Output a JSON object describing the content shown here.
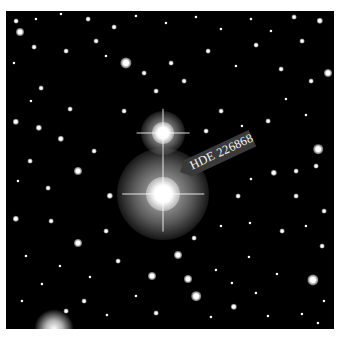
{
  "image": {
    "subject": "Star field photograph",
    "label": "HDE 226868",
    "background_color": "#000000",
    "frame_color": "#ffffff"
  },
  "bright_stars": [
    {
      "name": "upper-bright-star",
      "x": 157,
      "y": 122,
      "core": 22,
      "halo": 44
    },
    {
      "name": "target-star",
      "x": 157,
      "y": 183,
      "core": 34,
      "halo": 92
    }
  ],
  "stars": [
    {
      "x": 10,
      "y": 10,
      "r": 3
    },
    {
      "x": 30,
      "y": 8,
      "r": 2
    },
    {
      "x": 55,
      "y": 3,
      "r": 2
    },
    {
      "x": 82,
      "y": 8,
      "r": 3
    },
    {
      "x": 108,
      "y": 16,
      "r": 3
    },
    {
      "x": 130,
      "y": 5,
      "r": 2
    },
    {
      "x": 160,
      "y": 12,
      "r": 2
    },
    {
      "x": 190,
      "y": 6,
      "r": 2
    },
    {
      "x": 215,
      "y": 18,
      "r": 2
    },
    {
      "x": 245,
      "y": 8,
      "r": 2
    },
    {
      "x": 265,
      "y": 20,
      "r": 2
    },
    {
      "x": 288,
      "y": 6,
      "r": 3
    },
    {
      "x": 314,
      "y": 10,
      "r": 4
    },
    {
      "x": 14,
      "y": 21,
      "r": 5
    },
    {
      "x": 28,
      "y": 36,
      "r": 3
    },
    {
      "x": 60,
      "y": 40,
      "r": 3
    },
    {
      "x": 90,
      "y": 30,
      "r": 3
    },
    {
      "x": 120,
      "y": 52,
      "r": 7
    },
    {
      "x": 100,
      "y": 45,
      "r": 2
    },
    {
      "x": 138,
      "y": 62,
      "r": 3
    },
    {
      "x": 150,
      "y": 80,
      "r": 3
    },
    {
      "x": 165,
      "y": 52,
      "r": 3
    },
    {
      "x": 178,
      "y": 70,
      "r": 3
    },
    {
      "x": 202,
      "y": 40,
      "r": 3
    },
    {
      "x": 230,
      "y": 55,
      "r": 2
    },
    {
      "x": 250,
      "y": 34,
      "r": 3
    },
    {
      "x": 275,
      "y": 58,
      "r": 3
    },
    {
      "x": 296,
      "y": 30,
      "r": 3
    },
    {
      "x": 305,
      "y": 70,
      "r": 3
    },
    {
      "x": 322,
      "y": 62,
      "r": 5
    },
    {
      "x": 8,
      "y": 52,
      "r": 2
    },
    {
      "x": 35,
      "y": 77,
      "r": 3
    },
    {
      "x": 10,
      "y": 111,
      "r": 4
    },
    {
      "x": 25,
      "y": 90,
      "r": 2
    },
    {
      "x": 33,
      "y": 117,
      "r": 4
    },
    {
      "x": 55,
      "y": 128,
      "r": 4
    },
    {
      "x": 64,
      "y": 98,
      "r": 3
    },
    {
      "x": 72,
      "y": 160,
      "r": 5
    },
    {
      "x": 24,
      "y": 150,
      "r": 3
    },
    {
      "x": 12,
      "y": 170,
      "r": 2
    },
    {
      "x": 10,
      "y": 208,
      "r": 4
    },
    {
      "x": 42,
      "y": 177,
      "r": 3
    },
    {
      "x": 45,
      "y": 210,
      "r": 3
    },
    {
      "x": 72,
      "y": 232,
      "r": 5
    },
    {
      "x": 100,
      "y": 220,
      "r": 3
    },
    {
      "x": 104,
      "y": 185,
      "r": 4
    },
    {
      "x": 88,
      "y": 140,
      "r": 3
    },
    {
      "x": 118,
      "y": 100,
      "r": 3
    },
    {
      "x": 200,
      "y": 120,
      "r": 3
    },
    {
      "x": 215,
      "y": 100,
      "r": 3
    },
    {
      "x": 240,
      "y": 130,
      "r": 2
    },
    {
      "x": 236,
      "y": 115,
      "r": 2
    },
    {
      "x": 262,
      "y": 110,
      "r": 3
    },
    {
      "x": 280,
      "y": 88,
      "r": 2
    },
    {
      "x": 300,
      "y": 104,
      "r": 2
    },
    {
      "x": 312,
      "y": 138,
      "r": 6
    },
    {
      "x": 310,
      "y": 155,
      "r": 3
    },
    {
      "x": 290,
      "y": 160,
      "r": 3
    },
    {
      "x": 268,
      "y": 162,
      "r": 4
    },
    {
      "x": 245,
      "y": 168,
      "r": 2
    },
    {
      "x": 232,
      "y": 185,
      "r": 3
    },
    {
      "x": 290,
      "y": 185,
      "r": 3
    },
    {
      "x": 318,
      "y": 200,
      "r": 3
    },
    {
      "x": 300,
      "y": 215,
      "r": 2
    },
    {
      "x": 276,
      "y": 220,
      "r": 3
    },
    {
      "x": 244,
      "y": 212,
      "r": 2
    },
    {
      "x": 215,
      "y": 215,
      "r": 2
    },
    {
      "x": 188,
      "y": 227,
      "r": 3
    },
    {
      "x": 172,
      "y": 244,
      "r": 5
    },
    {
      "x": 182,
      "y": 268,
      "r": 5
    },
    {
      "x": 190,
      "y": 285,
      "r": 6
    },
    {
      "x": 146,
      "y": 265,
      "r": 5
    },
    {
      "x": 130,
      "y": 285,
      "r": 2
    },
    {
      "x": 112,
      "y": 250,
      "r": 3
    },
    {
      "x": 84,
      "y": 266,
      "r": 2
    },
    {
      "x": 54,
      "y": 255,
      "r": 2
    },
    {
      "x": 36,
      "y": 273,
      "r": 2
    },
    {
      "x": 20,
      "y": 245,
      "r": 2
    },
    {
      "x": 16,
      "y": 290,
      "r": 2
    },
    {
      "x": 60,
      "y": 300,
      "r": 3
    },
    {
      "x": 78,
      "y": 290,
      "r": 3
    },
    {
      "x": 101,
      "y": 304,
      "r": 2
    },
    {
      "x": 150,
      "y": 302,
      "r": 3
    },
    {
      "x": 205,
      "y": 306,
      "r": 2
    },
    {
      "x": 228,
      "y": 296,
      "r": 4
    },
    {
      "x": 250,
      "y": 282,
      "r": 2
    },
    {
      "x": 262,
      "y": 305,
      "r": 2
    },
    {
      "x": 271,
      "y": 263,
      "r": 2
    },
    {
      "x": 307,
      "y": 269,
      "r": 7
    },
    {
      "x": 318,
      "y": 290,
      "r": 2
    },
    {
      "x": 296,
      "y": 303,
      "r": 2
    },
    {
      "x": 312,
      "y": 312,
      "r": 2
    },
    {
      "x": 210,
      "y": 259,
      "r": 2
    },
    {
      "x": 243,
      "y": 246,
      "r": 2
    },
    {
      "x": 226,
      "y": 272,
      "r": 2
    },
    {
      "x": 316,
      "y": 235,
      "r": 3
    }
  ],
  "bottom_glow": {
    "x": 48,
    "y": 318,
    "r": 40
  }
}
